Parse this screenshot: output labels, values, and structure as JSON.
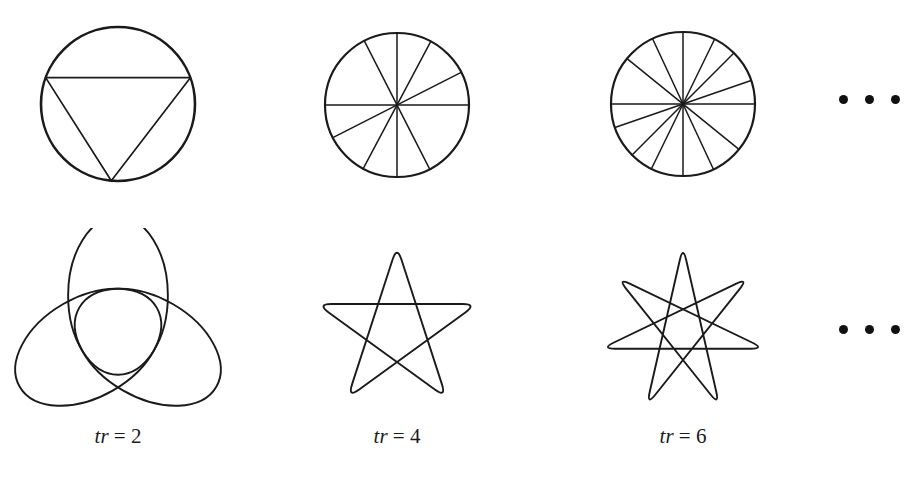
{
  "figure": {
    "background_color": "#ffffff",
    "stroke_color": "#1a1a1a",
    "columns": [
      {
        "label_var": "tr",
        "label_eq": "=",
        "label_value": "2",
        "caption_text": "tr = 2",
        "top_figure": {
          "name": "circle-with-3-chords",
          "kind": "circle-chords",
          "center": [
            118,
            104
          ],
          "radius": 77,
          "circle_stroke_width": 2.6,
          "chord_stroke_width": 1.7,
          "point_count": 3,
          "step": 1,
          "start_angle_deg": 160,
          "chord_endpoints_deg": [
            160,
            20,
            265
          ],
          "chords": [
            [
              0,
              1
            ],
            [
              1,
              2
            ],
            [
              2,
              0
            ]
          ]
        },
        "bottom_figure": {
          "name": "rose-curve-3-petal",
          "kind": "rose",
          "center": [
            118,
            330
          ],
          "radius": 86,
          "petals": 3,
          "inner_ratio": 0.33,
          "rotation_deg": -90,
          "stroke_width": 1.9
        }
      },
      {
        "label_var": "tr",
        "label_eq": "=",
        "label_value": "4",
        "caption_text": "tr = 4",
        "top_figure": {
          "name": "circle-with-5-diameters",
          "kind": "circle-diameters",
          "center": [
            397,
            105
          ],
          "radius": 72,
          "circle_stroke_width": 2.2,
          "chord_stroke_width": 1.5,
          "diameter_count": 5,
          "diameter_angles_deg": [
            0,
            27,
            62,
            90,
            117
          ]
        },
        "bottom_figure": {
          "name": "rose-curve-5-point-star",
          "kind": "rose",
          "center": [
            397,
            330
          ],
          "radius": 84,
          "petals": 5,
          "inner_ratio": 0.52,
          "rotation_deg": -90,
          "stroke_width": 1.9
        }
      },
      {
        "label_var": "tr",
        "label_eq": "=",
        "label_value": "6",
        "caption_text": "tr = 6",
        "top_figure": {
          "name": "circle-with-7-diameters",
          "kind": "circle-diameters",
          "center": [
            683,
            104
          ],
          "radius": 72,
          "circle_stroke_width": 2.2,
          "chord_stroke_width": 1.5,
          "diameter_count": 7,
          "diameter_angles_deg": [
            0,
            19,
            45,
            64,
            90,
            115,
            141
          ]
        },
        "bottom_figure": {
          "name": "rose-curve-7-point-star",
          "kind": "rose",
          "center": [
            683,
            330
          ],
          "radius": 84,
          "petals": 7,
          "inner_ratio": 0.66,
          "rotation_deg": -90,
          "stroke_width": 1.9
        }
      }
    ],
    "ellipses": [
      {
        "name": "ellipsis-top-row",
        "dots": 3,
        "center": [
          869,
          100
        ]
      },
      {
        "name": "ellipsis-bottom-row",
        "dots": 3,
        "center": [
          869,
          330
        ]
      }
    ]
  },
  "chart_data": {
    "type": "diagram",
    "series_label": "tr",
    "tr_values": [
      2,
      4,
      6
    ],
    "top_row": {
      "description": "circles subdivided by chords/diameters",
      "chord_counts": [
        3,
        5,
        7
      ]
    },
    "bottom_row": {
      "description": "rose / star curves",
      "petal_counts": [
        3,
        5,
        7
      ]
    },
    "continuation": "..."
  }
}
